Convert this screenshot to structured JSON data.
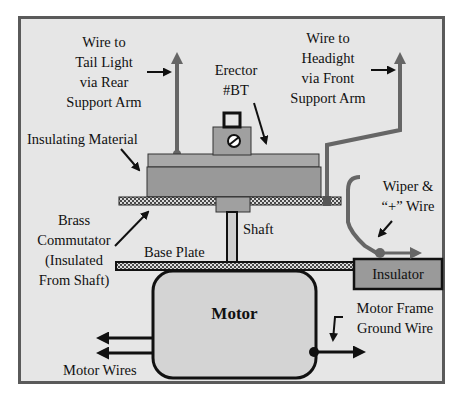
{
  "diagram": {
    "labels": {
      "tail_light": [
        "Wire to",
        "Tail Light",
        "via Rear",
        "Support Arm"
      ],
      "erector": [
        "Erector",
        "#BT"
      ],
      "headlight": [
        "Wire to",
        "Headight",
        "via Front",
        "Support Arm"
      ],
      "insulating_material": "Insulating Material",
      "wiper": [
        "Wiper &",
        "“+” Wire"
      ],
      "brass_commutator": [
        "Brass",
        "Commutator",
        "(Insulated",
        "From Shaft)"
      ],
      "shaft": "Shaft",
      "base_plate": "Base Plate",
      "insulator": "Insulator",
      "motor": "Motor",
      "motor_frame_ground": [
        "Motor Frame",
        "Ground Wire"
      ],
      "motor_wires": "Motor Wires"
    },
    "colors": {
      "background": "#e6e6e6",
      "border": "#555555",
      "insulating_block": "#999999",
      "insulating_top": "#a6a6a6",
      "motor_fill": "#d4d4d4",
      "insulator_fill": "#9a9a9a",
      "wire_gray": "#666666",
      "line_black": "#111111"
    }
  }
}
